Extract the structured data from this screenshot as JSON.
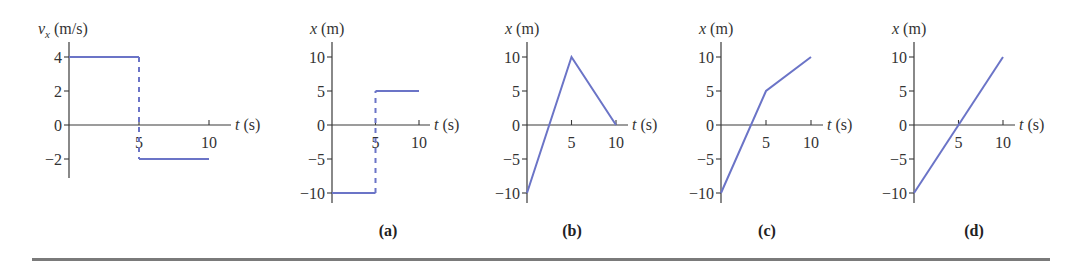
{
  "figure": {
    "bottom_rule": true
  },
  "colors": {
    "series": "#6b74c7",
    "axis": "#3a3a3a",
    "text": "#333333",
    "rule": "#7a7a7a"
  },
  "chart_data": [
    {
      "id": "velocity",
      "type": "line",
      "panel_label": "",
      "ylabel_var": "v",
      "ylabel_sub": "x",
      "ylabel_unit": " (m/s)",
      "xlabel_var": "t",
      "xlabel_unit": " (s)",
      "xlim": [
        0,
        10
      ],
      "ylim": [
        -3,
        4.8
      ],
      "xticks": [
        5,
        10
      ],
      "xtick_labels": [
        "5",
        "10"
      ],
      "yticks": [
        4,
        2,
        0,
        -2
      ],
      "ytick_labels": [
        "4",
        "2",
        "0",
        "−2"
      ],
      "segments": [
        {
          "style": "solid",
          "x": [
            0,
            5
          ],
          "y": [
            4,
            4
          ]
        },
        {
          "style": "dashed",
          "x": [
            5,
            5
          ],
          "y": [
            4,
            -2
          ]
        },
        {
          "style": "solid",
          "x": [
            5,
            10
          ],
          "y": [
            -2,
            -2
          ]
        }
      ]
    },
    {
      "id": "a",
      "type": "line",
      "panel_label": "(a)",
      "ylabel_var": "x",
      "ylabel_sub": "",
      "ylabel_unit": " (m)",
      "xlabel_var": "t",
      "xlabel_unit": " (s)",
      "xlim": [
        0,
        10
      ],
      "ylim": [
        -12,
        12
      ],
      "xticks": [
        5,
        10
      ],
      "xtick_labels": [
        "5",
        "10"
      ],
      "yticks": [
        10,
        5,
        0,
        -5,
        -10
      ],
      "ytick_labels": [
        "10",
        "5",
        "0",
        "−5",
        "−10"
      ],
      "segments": [
        {
          "style": "solid",
          "x": [
            0,
            5
          ],
          "y": [
            -10,
            -10
          ]
        },
        {
          "style": "dashed",
          "x": [
            5,
            5
          ],
          "y": [
            -10,
            5
          ]
        },
        {
          "style": "solid",
          "x": [
            5,
            10
          ],
          "y": [
            5,
            5
          ]
        }
      ]
    },
    {
      "id": "b",
      "type": "line",
      "panel_label": "(b)",
      "ylabel_var": "x",
      "ylabel_sub": "",
      "ylabel_unit": " (m)",
      "xlabel_var": "t",
      "xlabel_unit": " (s)",
      "xlim": [
        0,
        10
      ],
      "ylim": [
        -12,
        12
      ],
      "xticks": [
        5,
        10
      ],
      "xtick_labels": [
        "5",
        "10"
      ],
      "yticks": [
        10,
        5,
        0,
        -5,
        -10
      ],
      "ytick_labels": [
        "10",
        "5",
        "0",
        "−5",
        "−10"
      ],
      "segments": [
        {
          "style": "solid",
          "x": [
            0,
            5,
            10
          ],
          "y": [
            -10,
            10,
            0
          ]
        }
      ]
    },
    {
      "id": "c",
      "type": "line",
      "panel_label": "(c)",
      "ylabel_var": "x",
      "ylabel_sub": "",
      "ylabel_unit": " (m)",
      "xlabel_var": "t",
      "xlabel_unit": " (s)",
      "xlim": [
        0,
        10
      ],
      "ylim": [
        -12,
        12
      ],
      "xticks": [
        5,
        10
      ],
      "xtick_labels": [
        "5",
        "10"
      ],
      "yticks": [
        10,
        5,
        0,
        -5,
        -10
      ],
      "ytick_labels": [
        "10",
        "5",
        "0",
        "−5",
        "−10"
      ],
      "segments": [
        {
          "style": "solid",
          "x": [
            0,
            5,
            10
          ],
          "y": [
            -10,
            5,
            10
          ]
        }
      ]
    },
    {
      "id": "d",
      "type": "line",
      "panel_label": "(d)",
      "ylabel_var": "x",
      "ylabel_sub": "",
      "ylabel_unit": " (m)",
      "xlabel_var": "t",
      "xlabel_unit": " (s)",
      "xlim": [
        0,
        10
      ],
      "ylim": [
        -12,
        12
      ],
      "xticks": [
        5,
        10
      ],
      "xtick_labels": [
        "5",
        "10"
      ],
      "yticks": [
        10,
        5,
        0,
        -5,
        -10
      ],
      "ytick_labels": [
        "10",
        "5",
        "0",
        "−5",
        "−10"
      ],
      "segments": [
        {
          "style": "solid",
          "x": [
            0,
            10
          ],
          "y": [
            -10,
            10
          ]
        }
      ]
    }
  ]
}
